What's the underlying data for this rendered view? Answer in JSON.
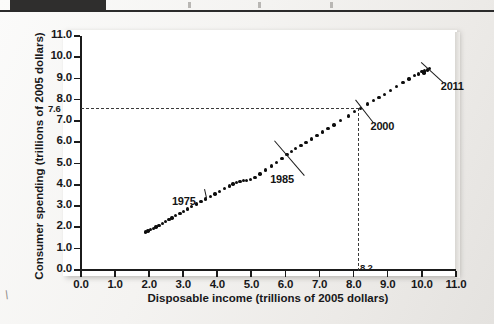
{
  "figure": {
    "page_background": "#f2f1ef",
    "plot_background": "#ffffff",
    "axis_color": "#1b1b1b",
    "point_color": "#0d0d0d",
    "guide_color": "#3a3a3a",
    "corner_mark": "\\"
  },
  "chart_data": {
    "type": "scatter",
    "title": "",
    "xlabel": "Disposable income (trillions of 2005 dollars)",
    "ylabel": "Consumer spending (trillions of 2005 dollars)",
    "xlim": [
      0.0,
      11.0
    ],
    "ylim": [
      0.0,
      11.0
    ],
    "grid": false,
    "legend": "none",
    "xticks": [
      "0.0",
      "1.0",
      "2.0",
      "3.0",
      "4.0",
      "5.0",
      "6.0",
      "7.0",
      "8.0",
      "9.0",
      "10.0",
      "11.0"
    ],
    "yticks": [
      "0.0",
      "1.0",
      "2.0",
      "3.0",
      "4.0",
      "5.0",
      "6.0",
      "7.0",
      "8.0",
      "9.0",
      "10.0",
      "11.0"
    ],
    "extra_x_label": "8.2",
    "extra_y_label": "7.6",
    "reference_lines": {
      "x": 8.2,
      "y": 7.6,
      "style": "dashed",
      "meaning": "year 2000 point"
    },
    "annotations": [
      {
        "label": "1975",
        "x": 3.9,
        "y": 3.6
      },
      {
        "label": "1985",
        "x": 5.9,
        "y": 5.4
      },
      {
        "label": "2000",
        "x": 8.2,
        "y": 7.6
      },
      {
        "label": "2011",
        "x": 10.2,
        "y": 9.4
      }
    ],
    "points": [
      {
        "x": 1.9,
        "y": 1.78
      },
      {
        "x": 1.97,
        "y": 1.84
      },
      {
        "x": 2.04,
        "y": 1.9
      },
      {
        "x": 2.12,
        "y": 1.96
      },
      {
        "x": 2.2,
        "y": 2.03
      },
      {
        "x": 2.29,
        "y": 2.1
      },
      {
        "x": 2.39,
        "y": 2.19
      },
      {
        "x": 2.48,
        "y": 2.27
      },
      {
        "x": 2.58,
        "y": 2.36
      },
      {
        "x": 2.67,
        "y": 2.45
      },
      {
        "x": 2.78,
        "y": 2.55
      },
      {
        "x": 2.9,
        "y": 2.66
      },
      {
        "x": 3.01,
        "y": 2.76
      },
      {
        "x": 3.12,
        "y": 2.87
      },
      {
        "x": 3.24,
        "y": 2.98
      },
      {
        "x": 3.38,
        "y": 3.1
      },
      {
        "x": 3.52,
        "y": 3.22
      },
      {
        "x": 3.66,
        "y": 3.33
      },
      {
        "x": 3.8,
        "y": 3.46
      },
      {
        "x": 3.93,
        "y": 3.58
      },
      {
        "x": 4.06,
        "y": 3.7
      },
      {
        "x": 4.21,
        "y": 3.82
      },
      {
        "x": 4.35,
        "y": 3.94
      },
      {
        "x": 4.46,
        "y": 4.04
      },
      {
        "x": 4.56,
        "y": 4.12
      },
      {
        "x": 4.66,
        "y": 4.17
      },
      {
        "x": 4.76,
        "y": 4.2
      },
      {
        "x": 4.86,
        "y": 4.22
      },
      {
        "x": 4.97,
        "y": 4.26
      },
      {
        "x": 5.1,
        "y": 4.36
      },
      {
        "x": 5.25,
        "y": 4.52
      },
      {
        "x": 5.42,
        "y": 4.7
      },
      {
        "x": 5.58,
        "y": 4.88
      },
      {
        "x": 5.74,
        "y": 5.06
      },
      {
        "x": 5.9,
        "y": 5.24
      },
      {
        "x": 6.04,
        "y": 5.42
      },
      {
        "x": 6.18,
        "y": 5.58
      },
      {
        "x": 6.3,
        "y": 5.7
      },
      {
        "x": 6.45,
        "y": 5.84
      },
      {
        "x": 6.6,
        "y": 6.0
      },
      {
        "x": 6.76,
        "y": 6.16
      },
      {
        "x": 6.92,
        "y": 6.32
      },
      {
        "x": 7.08,
        "y": 6.48
      },
      {
        "x": 7.24,
        "y": 6.64
      },
      {
        "x": 7.42,
        "y": 6.82
      },
      {
        "x": 7.62,
        "y": 7.02
      },
      {
        "x": 7.84,
        "y": 7.24
      },
      {
        "x": 8.02,
        "y": 7.44
      },
      {
        "x": 8.2,
        "y": 7.6
      },
      {
        "x": 8.4,
        "y": 7.8
      },
      {
        "x": 8.58,
        "y": 7.98
      },
      {
        "x": 8.74,
        "y": 8.12
      },
      {
        "x": 8.9,
        "y": 8.26
      },
      {
        "x": 9.08,
        "y": 8.44
      },
      {
        "x": 9.26,
        "y": 8.62
      },
      {
        "x": 9.44,
        "y": 8.8
      },
      {
        "x": 9.62,
        "y": 8.98
      },
      {
        "x": 9.78,
        "y": 9.14
      },
      {
        "x": 9.9,
        "y": 9.22
      },
      {
        "x": 10.0,
        "y": 9.32
      },
      {
        "x": 10.08,
        "y": 9.36
      },
      {
        "x": 10.16,
        "y": 9.4
      },
      {
        "x": 10.06,
        "y": 9.26
      },
      {
        "x": 10.22,
        "y": 9.46
      }
    ]
  }
}
